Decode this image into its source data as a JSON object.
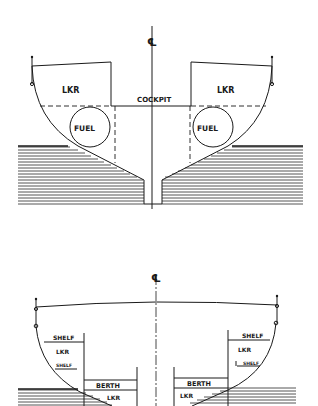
{
  "diagram": {
    "top_section": {
      "centerline_symbol": "℄",
      "labels": {
        "locker_left": "LKR",
        "locker_right": "LKR",
        "cockpit": "COCKPIT",
        "fuel_left": "FUEL",
        "fuel_right": "FUEL"
      }
    },
    "bottom_section": {
      "centerline_symbol": "℄",
      "labels": {
        "shelf_upper_left": "SHELF",
        "locker_upper_left": "LKR",
        "shelf_lower_left": "SHELF",
        "berth_left": "BERTH",
        "locker_lower_left": "LKR",
        "shelf_upper_right": "SHELF",
        "locker_upper_right": "LKR",
        "shelf_lower_right": "SHELF",
        "berth_right": "BERTH",
        "locker_lower_right": "LKR"
      }
    },
    "colors": {
      "ink": "#1a1a1a",
      "background": "#ffffff"
    }
  }
}
